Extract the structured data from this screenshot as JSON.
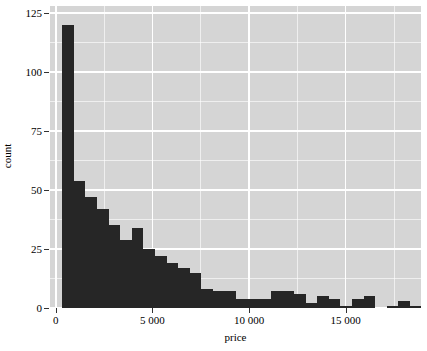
{
  "chart_data": {
    "type": "bar",
    "title": "",
    "subtitle": "",
    "xlabel": "price",
    "ylabel": "count",
    "xlim": [
      -300,
      18900
    ],
    "ylim": [
      0,
      128
    ],
    "grid": true,
    "legend": null,
    "bin_width": 600,
    "bin_start": 330,
    "x_ticks": [
      {
        "value": 0,
        "label": "0"
      },
      {
        "value": 5000,
        "label": "5 000"
      },
      {
        "value": 10000,
        "label": "10 000"
      },
      {
        "value": 15000,
        "label": "15 000"
      }
    ],
    "x_minor_ticks": [
      2500,
      7500,
      12500,
      17500
    ],
    "y_ticks": [
      {
        "value": 0,
        "label": "0"
      },
      {
        "value": 25,
        "label": "25"
      },
      {
        "value": 50,
        "label": "50"
      },
      {
        "value": 75,
        "label": "75"
      },
      {
        "value": 100,
        "label": "100"
      },
      {
        "value": 125,
        "label": "125"
      }
    ],
    "y_minor_ticks": [
      12.5,
      37.5,
      62.5,
      87.5,
      112.5
    ],
    "bins": [
      {
        "x0": 330,
        "x1": 930,
        "center": 630,
        "count": 120
      },
      {
        "x0": 930,
        "x1": 1530,
        "center": 1230,
        "count": 54
      },
      {
        "x0": 1530,
        "x1": 2130,
        "center": 1830,
        "count": 47
      },
      {
        "x0": 2130,
        "x1": 2730,
        "center": 2430,
        "count": 42
      },
      {
        "x0": 2730,
        "x1": 3330,
        "center": 3030,
        "count": 35
      },
      {
        "x0": 3330,
        "x1": 3930,
        "center": 3630,
        "count": 29
      },
      {
        "x0": 3930,
        "x1": 4530,
        "center": 4230,
        "count": 34
      },
      {
        "x0": 4530,
        "x1": 5130,
        "center": 4830,
        "count": 25
      },
      {
        "x0": 5130,
        "x1": 5730,
        "center": 5430,
        "count": 22
      },
      {
        "x0": 5730,
        "x1": 6330,
        "center": 6030,
        "count": 19
      },
      {
        "x0": 6330,
        "x1": 6930,
        "center": 6630,
        "count": 17
      },
      {
        "x0": 6930,
        "x1": 7530,
        "center": 7230,
        "count": 15
      },
      {
        "x0": 7530,
        "x1": 8130,
        "center": 7830,
        "count": 8
      },
      {
        "x0": 8130,
        "x1": 8730,
        "center": 8430,
        "count": 7
      },
      {
        "x0": 8730,
        "x1": 9330,
        "center": 9030,
        "count": 7
      },
      {
        "x0": 9330,
        "x1": 9930,
        "center": 9630,
        "count": 4
      },
      {
        "x0": 9930,
        "x1": 10530,
        "center": 10230,
        "count": 4
      },
      {
        "x0": 10530,
        "x1": 11130,
        "center": 10830,
        "count": 4
      },
      {
        "x0": 11130,
        "x1": 11730,
        "center": 11430,
        "count": 7
      },
      {
        "x0": 11730,
        "x1": 12330,
        "center": 12030,
        "count": 7
      },
      {
        "x0": 12330,
        "x1": 12930,
        "center": 12630,
        "count": 6
      },
      {
        "x0": 12930,
        "x1": 13530,
        "center": 13230,
        "count": 2
      },
      {
        "x0": 13530,
        "x1": 14130,
        "center": 13830,
        "count": 5
      },
      {
        "x0": 14130,
        "x1": 14730,
        "center": 14430,
        "count": 4
      },
      {
        "x0": 14730,
        "x1": 15330,
        "center": 15030,
        "count": 1
      },
      {
        "x0": 15330,
        "x1": 15930,
        "center": 15630,
        "count": 4
      },
      {
        "x0": 15930,
        "x1": 16530,
        "center": 16230,
        "count": 5
      },
      {
        "x0": 16530,
        "x1": 17130,
        "center": 16830,
        "count": 0
      },
      {
        "x0": 17130,
        "x1": 17730,
        "center": 17430,
        "count": 1
      },
      {
        "x0": 17730,
        "x1": 18330,
        "center": 18030,
        "count": 3
      },
      {
        "x0": 18330,
        "x1": 18930,
        "center": 18630,
        "count": 1
      }
    ],
    "colors": {
      "bar_fill": "#262626",
      "panel_background": "#d5d5d5",
      "grid_line": "#ffffff",
      "axis_text": "#000000",
      "tick_mark": "#333333",
      "figure_background": "#ffffff"
    }
  }
}
